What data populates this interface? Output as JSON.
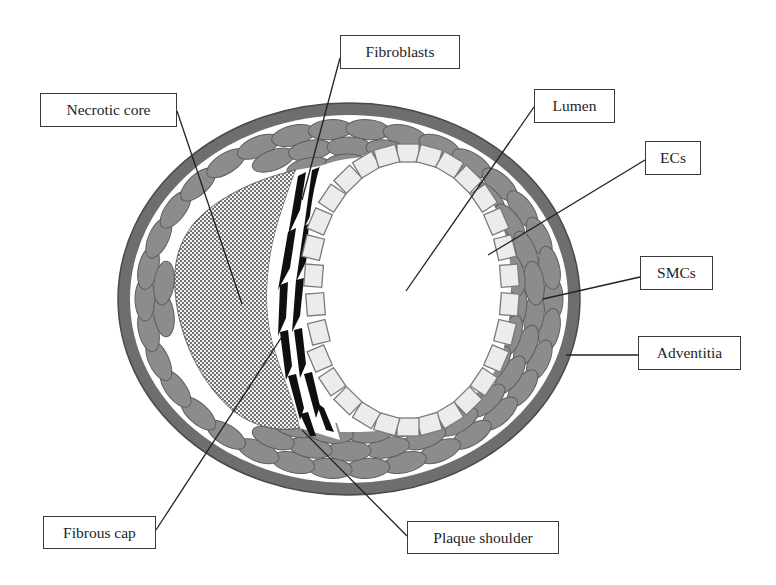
{
  "figure": {
    "type": "schematic cross-section of an artery with atherosclerotic plaque",
    "colors": {
      "background": "#ffffff",
      "adventitia": "#6e6e6e",
      "smc_fill": "#8c8c8c",
      "smc_stroke": "#5e5e5e",
      "ec_fill": "#ececec",
      "ec_stroke": "#7a7a7a",
      "necrotic_core_dots": "#3c3c3c",
      "fibroblast": "#0f0f0f",
      "label_border": "#3a3a3a",
      "leader_line": "#222222"
    }
  },
  "labels": {
    "necrotic_core": "Necrotic core",
    "fibroblasts": "Fibroblasts",
    "lumen": "Lumen",
    "ecs": "ECs",
    "smcs": "SMCs",
    "adventitia": "Adventitia",
    "fibrous_cap": "Fibrous cap",
    "plaque_shoulder": "Plaque shoulder"
  }
}
